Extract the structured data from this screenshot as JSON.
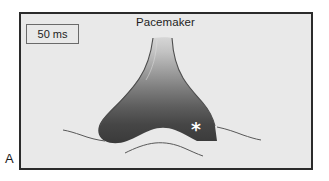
{
  "figure": {
    "panel_letter": "A",
    "frame": {
      "border_color": "#2b2b2b",
      "background_color": "#e9e9e9"
    },
    "annotations": {
      "pacemaker_label": "Pacemaker",
      "scale_box_label": "50 ms",
      "asterisk_marker": "*",
      "asterisk_color": "#ffffff"
    },
    "wavefront": {
      "description": "three-pronged dark activation wavefront",
      "gradient_light": "#d0d0d0",
      "gradient_dark": "#3a3a3a",
      "outline_color": "#4a4a4a"
    }
  }
}
